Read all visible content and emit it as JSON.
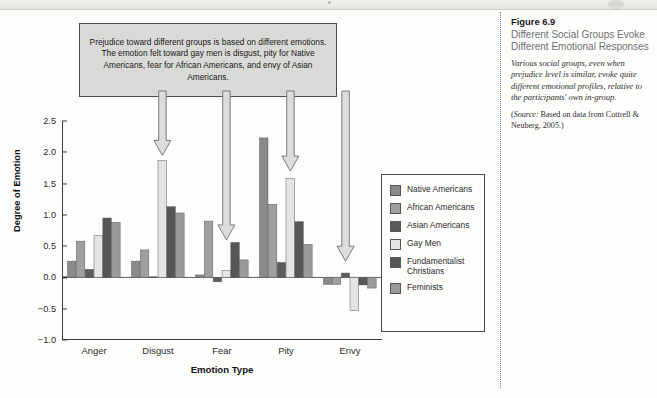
{
  "annotation": {
    "text": "Prejudice toward different groups is based on different emotions. The emotion felt toward gay men is disgust, pity for Native Americans, fear for African Americans, and envy of Asian Americans."
  },
  "caption": {
    "figure_number": "Figure 6.9",
    "title": "Different Social Groups Evoke Different Emotional Responses",
    "description": "Various social groups, even when prejudice level is similar, evoke quite different emotional profiles, relative to the participants' own in-group.",
    "source_label": "Source:",
    "source_text": "Based on data from Cottrell & Neuberg, 2005.)",
    "source_open_paren": "("
  },
  "chart_data": {
    "type": "bar",
    "title": "",
    "xlabel": "Emotion Type",
    "ylabel": "Degree of Emotion",
    "categories": [
      "Anger",
      "Disgust",
      "Fear",
      "Pity",
      "Envy"
    ],
    "ylim": [
      -1.0,
      2.5
    ],
    "yticks": [
      -1.0,
      -0.5,
      0.0,
      0.5,
      1.0,
      1.5,
      2.0,
      2.5
    ],
    "ytick_labels": [
      "−1.0",
      "−0.5",
      "0.0",
      "0.5",
      "1.0",
      "1.5",
      "2.0",
      "2.5"
    ],
    "grid": false,
    "legend_position": "right",
    "series": [
      {
        "name": "Native Americans",
        "color": "#8a8a8a",
        "values": [
          0.26,
          0.26,
          0.04,
          2.23,
          -0.11
        ]
      },
      {
        "name": "African Americans",
        "color": "#9f9f9f",
        "values": [
          0.58,
          0.44,
          0.9,
          1.17,
          -0.11
        ]
      },
      {
        "name": "Asian Americans",
        "color": "#5b5b5b",
        "values": [
          0.13,
          0.01,
          -0.07,
          0.24,
          0.07
        ]
      },
      {
        "name": "Gay Men",
        "color": "#e3e3e1",
        "values": [
          0.67,
          1.87,
          0.11,
          1.58,
          -0.53
        ]
      },
      {
        "name": "Fundamentalist Christians",
        "color": "#565656",
        "values": [
          0.95,
          1.13,
          0.56,
          0.89,
          -0.12
        ]
      },
      {
        "name": "Feminists",
        "color": "#9a9a9a",
        "values": [
          0.88,
          1.03,
          0.28,
          0.53,
          -0.17
        ]
      }
    ],
    "annotation_arrows": [
      {
        "target_category": "Disgust",
        "target_series": "Gay Men",
        "tip_value": 1.95
      },
      {
        "target_category": "Fear",
        "target_series": "Gay Men",
        "tip_value": 0.6
      },
      {
        "target_category": "Pity",
        "target_series": "Gay Men",
        "tip_value": 1.7
      },
      {
        "target_category": "Envy",
        "target_series": "Asian Americans",
        "tip_value": 0.26
      }
    ]
  },
  "legend": {
    "items": [
      {
        "label": "Native Americans",
        "color": "#8a8a8a"
      },
      {
        "label": "African Americans",
        "color": "#9f9f9f"
      },
      {
        "label": "Asian Americans",
        "color": "#5b5b5b"
      },
      {
        "label": "Gay Men",
        "color": "#e3e3e1"
      },
      {
        "label": "Fundamentalist Christians",
        "color": "#565656"
      },
      {
        "label": "Feminists",
        "color": "#9a9a9a"
      }
    ]
  }
}
